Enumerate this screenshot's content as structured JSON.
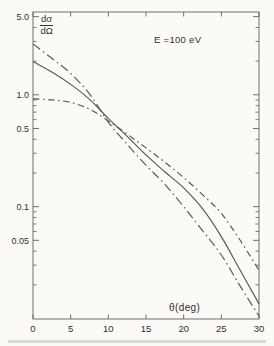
{
  "figure": {
    "background": "#fbfaf7",
    "frame_color": "#6e6e6e",
    "text_color": "#2f2f2f",
    "curve_color": "#575757",
    "ylabel_numerator": "dσ",
    "ylabel_denominator": "dΩ",
    "annotation": "E =100 eV",
    "xlabel": "θ(deg)"
  },
  "chart_data": {
    "type": "line",
    "title": "",
    "xlabel": "θ(deg)",
    "ylabel": "dσ/dΩ",
    "annotation": "E =100 eV",
    "grid": false,
    "legend": null,
    "x_axis": {
      "scale": "linear",
      "min": 0,
      "max": 30,
      "ticks": [
        {
          "v": 0,
          "label": "0"
        },
        {
          "v": 5,
          "label": "5"
        },
        {
          "v": 10,
          "label": "10"
        },
        {
          "v": 15,
          "label": "15"
        },
        {
          "v": 20,
          "label": "20"
        },
        {
          "v": 25,
          "label": "25"
        },
        {
          "v": 30,
          "label": "30"
        }
      ]
    },
    "y_axis": {
      "scale": "log",
      "min": 0.0099,
      "max": 5.5,
      "major_ticks": [
        {
          "v": 5.0,
          "label": "5.0"
        },
        {
          "v": 1.0,
          "label": "1.0"
        },
        {
          "v": 0.5,
          "label": "0.5"
        },
        {
          "v": 0.1,
          "label": "0.1"
        },
        {
          "v": 0.05,
          "label": "0.05"
        }
      ],
      "minor_ticks": [
        4,
        3,
        2,
        0.9,
        0.8,
        0.7,
        0.6,
        0.4,
        0.3,
        0.2,
        0.09,
        0.08,
        0.07,
        0.06,
        0.04,
        0.03,
        0.02
      ]
    },
    "series": [
      {
        "name": "steep-dash-dot-curve",
        "style": "dashdot-long",
        "points": [
          [
            0,
            2.85
          ],
          [
            2.5,
            2.12
          ],
          [
            5,
            1.55
          ],
          [
            7.5,
            1.02
          ],
          [
            10,
            0.57
          ],
          [
            12.5,
            0.36
          ],
          [
            15,
            0.235
          ],
          [
            17.5,
            0.158
          ],
          [
            20,
            0.1
          ],
          [
            22.5,
            0.061
          ],
          [
            25,
            0.037
          ],
          [
            27.5,
            0.0195
          ],
          [
            30,
            0.0105
          ]
        ]
      },
      {
        "name": "solid-curve",
        "style": "solid",
        "points": [
          [
            0,
            1.98
          ],
          [
            2.5,
            1.6
          ],
          [
            5,
            1.24
          ],
          [
            7.5,
            0.91
          ],
          [
            10,
            0.615
          ],
          [
            12.5,
            0.425
          ],
          [
            15,
            0.29
          ],
          [
            17.5,
            0.205
          ],
          [
            20,
            0.147
          ],
          [
            22.5,
            0.096
          ],
          [
            25,
            0.054
          ],
          [
            27.5,
            0.027
          ],
          [
            30,
            0.0135
          ]
        ]
      },
      {
        "name": "flat-dash-dot-curve",
        "style": "dashdot-short",
        "points": [
          [
            0,
            0.92
          ],
          [
            2.5,
            0.9
          ],
          [
            5,
            0.855
          ],
          [
            7.5,
            0.745
          ],
          [
            10,
            0.585
          ],
          [
            12.5,
            0.445
          ],
          [
            15,
            0.335
          ],
          [
            17.5,
            0.25
          ],
          [
            20,
            0.182
          ],
          [
            22.5,
            0.128
          ],
          [
            25,
            0.087
          ],
          [
            27.5,
            0.05
          ],
          [
            30,
            0.027
          ]
        ]
      }
    ]
  }
}
